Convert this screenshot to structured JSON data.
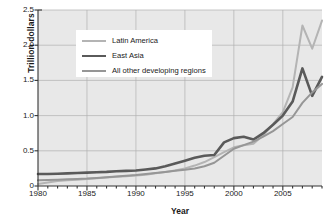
{
  "chart_data": {
    "type": "line",
    "title": "",
    "xlabel": "Year",
    "ylabel": "Trillion dollars",
    "xlim": [
      1980,
      2009
    ],
    "ylim": [
      0,
      2.5
    ],
    "grid": true,
    "legend_position": "upper-left-inside",
    "xticks": [
      "1980",
      "1985",
      "1990",
      "1995",
      "2000",
      "2005"
    ],
    "xtick_values": [
      1980,
      1985,
      1990,
      1995,
      2000,
      2005
    ],
    "xtick_minor_step": 1,
    "yticks": [
      "0",
      "0.5",
      "1.0",
      "1.5",
      "2.0",
      "2.5"
    ],
    "ytick_values": [
      0,
      0.5,
      1.0,
      1.5,
      2.0,
      2.5
    ],
    "x": [
      1980,
      1981,
      1982,
      1983,
      1984,
      1985,
      1986,
      1987,
      1988,
      1989,
      1990,
      1991,
      1992,
      1993,
      1994,
      1995,
      1996,
      1997,
      1998,
      1999,
      2000,
      2001,
      2002,
      2003,
      2004,
      2005,
      2006,
      2007,
      2008,
      2009
    ],
    "series": [
      {
        "name": "Latin America",
        "color": "#b4b4b4",
        "line_width": 2.0,
        "values": [
          0.03,
          0.05,
          0.07,
          0.08,
          0.09,
          0.1,
          0.11,
          0.12,
          0.13,
          0.14,
          0.15,
          0.16,
          0.18,
          0.2,
          0.22,
          0.25,
          0.29,
          0.34,
          0.41,
          0.48,
          0.55,
          0.58,
          0.6,
          0.72,
          0.88,
          1.05,
          1.4,
          2.28,
          1.95,
          2.35
        ]
      },
      {
        "name": "East Asia",
        "color": "#5a5a5a",
        "line_width": 2.6,
        "values": [
          0.17,
          0.17,
          0.175,
          0.18,
          0.185,
          0.19,
          0.195,
          0.2,
          0.21,
          0.215,
          0.22,
          0.235,
          0.25,
          0.28,
          0.32,
          0.36,
          0.4,
          0.43,
          0.44,
          0.62,
          0.68,
          0.7,
          0.66,
          0.75,
          0.87,
          1.0,
          1.2,
          1.67,
          1.28,
          1.55
        ]
      },
      {
        "name": "All other developing regions",
        "color": "#969696",
        "line_width": 2.0,
        "values": [
          0.08,
          0.085,
          0.09,
          0.095,
          0.1,
          0.105,
          0.115,
          0.125,
          0.135,
          0.145,
          0.155,
          0.17,
          0.185,
          0.2,
          0.215,
          0.23,
          0.25,
          0.28,
          0.33,
          0.43,
          0.53,
          0.58,
          0.63,
          0.7,
          0.78,
          0.88,
          0.98,
          1.18,
          1.33,
          1.45
        ]
      }
    ]
  },
  "axes": {
    "ylabel": "Trillion dollars",
    "xlabel": "Year"
  },
  "legend": {
    "entries": [
      {
        "label": "Latin America"
      },
      {
        "label": "East Asia"
      },
      {
        "label": "All other developing regions"
      }
    ]
  },
  "style": {
    "plot_background": "#e8e8e8",
    "grid_color": "#b0b0b0",
    "axis_color": "#333333",
    "text_color": "#1a1a1a",
    "page_background": "#ffffff"
  }
}
